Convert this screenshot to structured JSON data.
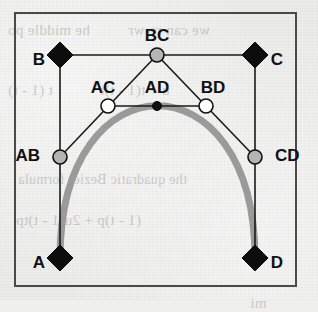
{
  "figure": {
    "background_color": "#ececeb",
    "frame_color": "#4a4a4a",
    "curve_color": "#9a9a9a",
    "line_color": "#1a1a1a",
    "frame": {
      "x": 15,
      "y": 13,
      "width": 281,
      "height": 273
    },
    "labels": {
      "A": "A",
      "B": "B",
      "C": "C",
      "D": "D",
      "AB": "AB",
      "BC": "BC",
      "CD": "CD",
      "AC": "AC",
      "BD": "BD",
      "AD": "AD"
    },
    "points": [
      {
        "id": "A",
        "label": "A",
        "x": 60,
        "y": 258,
        "marker": "diamond",
        "fill": "#0d0d0d",
        "label_x": 39,
        "label_y": 264,
        "label_anchor": "middle"
      },
      {
        "id": "B",
        "label": "B",
        "x": 60,
        "y": 55,
        "marker": "diamond",
        "fill": "#0d0d0d",
        "label_x": 39,
        "label_y": 61,
        "label_anchor": "middle"
      },
      {
        "id": "C",
        "label": "C",
        "x": 255,
        "y": 55,
        "marker": "diamond",
        "fill": "#0d0d0d",
        "label_x": 277,
        "label_y": 61,
        "label_anchor": "middle"
      },
      {
        "id": "D",
        "label": "D",
        "x": 255,
        "y": 258,
        "marker": "diamond",
        "fill": "#0d0d0d",
        "label_x": 277,
        "label_y": 264,
        "label_anchor": "middle"
      },
      {
        "id": "AB",
        "label": "AB",
        "x": 60,
        "y": 157,
        "marker": "circle",
        "fill": "#b5b5b5",
        "label_x": 40,
        "label_y": 157,
        "label_anchor": "end"
      },
      {
        "id": "BC",
        "label": "BC",
        "x": 157,
        "y": 55,
        "marker": "circle",
        "fill": "#b5b5b5",
        "label_x": 157,
        "label_y": 37,
        "label_anchor": "middle"
      },
      {
        "id": "CD",
        "label": "CD",
        "x": 255,
        "y": 157,
        "marker": "circle",
        "fill": "#b5b5b5",
        "label_x": 275,
        "label_y": 157,
        "label_anchor": "start"
      },
      {
        "id": "AC",
        "label": "AC",
        "x": 108,
        "y": 106,
        "marker": "circle",
        "fill": "#ffffff",
        "label_x": 103,
        "label_y": 89,
        "label_anchor": "middle"
      },
      {
        "id": "BD",
        "label": "BD",
        "x": 206,
        "y": 106,
        "marker": "circle",
        "fill": "#ffffff",
        "label_x": 213,
        "label_y": 89,
        "label_anchor": "middle"
      },
      {
        "id": "AD",
        "label": "AD",
        "x": 157,
        "y": 106,
        "marker": "dot",
        "fill": "#111111",
        "label_x": 157,
        "label_y": 89,
        "label_anchor": "middle"
      }
    ],
    "segments": [
      {
        "from": "A",
        "to": "B"
      },
      {
        "from": "B",
        "to": "C"
      },
      {
        "from": "C",
        "to": "D"
      },
      {
        "from": "AB",
        "to": "BC"
      },
      {
        "from": "BC",
        "to": "CD"
      },
      {
        "from": "AC",
        "to": "BD"
      }
    ],
    "curve": {
      "type": "cubic-bezier",
      "start": "A",
      "control1": "B",
      "control2": "C",
      "end": "D",
      "path": "M 60 258 C 60 55 255 55 255 258",
      "stroke_width": 7
    },
    "bleed_text": [
      {
        "text": "he middle po",
        "x": 8,
        "y": 22,
        "size": 15
      },
      {
        "text": "we can re-wr",
        "x": 128,
        "y": 22,
        "size": 15
      },
      {
        "text": "t (1 - t)",
        "x": 8,
        "y": 82,
        "size": 15
      },
      {
        "text": "u + t(1 - t)t",
        "x": 100,
        "y": 82,
        "size": 15
      },
      {
        "text": "the quadratic Bezier formula",
        "x": 18,
        "y": 172,
        "size": 14
      },
      {
        "text": "(1 - t)p + 2u(1 - t)tp",
        "x": 16,
        "y": 212,
        "size": 15
      },
      {
        "text": "mi",
        "x": 250,
        "y": 295,
        "size": 15
      }
    ]
  }
}
